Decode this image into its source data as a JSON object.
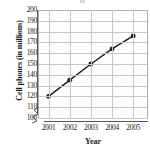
{
  "chart_data": {
    "type": "line",
    "title": "",
    "xlabel": "Year",
    "ylabel": "Cell phones (in millions)",
    "categories": [
      "2001",
      "2002",
      "2003",
      "2004",
      "2005"
    ],
    "x": [
      2001,
      2002,
      2003,
      2004,
      2005
    ],
    "values": [
      120,
      135,
      150,
      164,
      176
    ],
    "series": [
      {
        "name": "Cell phones",
        "values": [
          120,
          135,
          150,
          164,
          176
        ]
      }
    ],
    "xlim": [
      2000.5,
      2005.7
    ],
    "ylim": [
      100,
      200
    ],
    "ytick_labels": [
      "100",
      "110",
      "120",
      "130",
      "140",
      "150",
      "160",
      "170",
      "180",
      "190",
      "200"
    ],
    "ytick_values": [
      100,
      110,
      120,
      130,
      140,
      150,
      160,
      170,
      180,
      190,
      200
    ],
    "xtick_labels": [
      "2001",
      "2002",
      "2003",
      "2004",
      "2005"
    ],
    "grid": true,
    "legend": "none",
    "axis_break": "y-axis break below 100",
    "marker": "filled-circle",
    "line_color": "#231f20",
    "marker_color": "#231f20",
    "grid_color": "#c8c8c8",
    "axis_color": "#555555",
    "text_color": "#1c1c1c",
    "background": "#ffffff"
  }
}
